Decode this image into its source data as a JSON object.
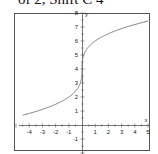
{
  "caption": "of 2, Shift C 4",
  "chart_data": {
    "type": "line",
    "title": "",
    "function": "y = 2*cbrt(x) + 4",
    "xlabel": "x",
    "ylabel": "y",
    "xlim": [
      -5,
      5
    ],
    "ylim": [
      -2,
      8
    ],
    "xticks": [
      -4,
      -3,
      -2,
      -1,
      1,
      2,
      3,
      4,
      5
    ],
    "yticks": [
      -1,
      1,
      2,
      3,
      4,
      5,
      6,
      7,
      8
    ],
    "grid": false,
    "series": [
      {
        "name": "f(x)",
        "x": [
          -4.5,
          -4,
          -3,
          -2,
          -1,
          -0.5,
          -0.1,
          0,
          0.1,
          0.5,
          1,
          2,
          3,
          4,
          5
        ],
        "y": [
          0.7,
          0.83,
          1.12,
          1.48,
          2.0,
          2.41,
          3.07,
          4.0,
          4.93,
          5.59,
          6.0,
          6.52,
          6.88,
          7.17,
          7.42
        ]
      }
    ],
    "colors": {
      "curve": "#777777",
      "axes": "#555555",
      "frame": "#555555"
    }
  }
}
